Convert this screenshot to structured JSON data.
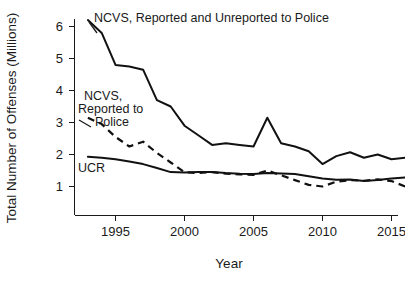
{
  "chart_data": {
    "type": "line",
    "title": "",
    "subtitle": "",
    "xlabel": "Year",
    "ylabel": "Total Number of Offenses (Millions)",
    "xlim": [
      1993,
      2016
    ],
    "ylim": [
      0.45,
      6.45
    ],
    "grid": false,
    "legend_position": "inline-annotations",
    "xticks": [
      1995,
      2000,
      2005,
      2010,
      2015
    ],
    "xtick_labels": [
      "1995",
      "2000",
      "2005",
      "2010",
      "2015"
    ],
    "yticks": [
      1,
      2,
      3,
      4,
      5,
      6
    ],
    "ytick_labels": [
      "1",
      "2",
      "3",
      "4",
      "5",
      "6"
    ],
    "x": [
      1993,
      1994,
      1995,
      1996,
      1997,
      1998,
      1999,
      2000,
      2001,
      2002,
      2003,
      2004,
      2005,
      2006,
      2007,
      2008,
      2009,
      2010,
      2011,
      2012,
      2013,
      2014,
      2015,
      2016
    ],
    "series": [
      {
        "name": "NCVS, Reported and Unreported to Police",
        "style": "solid",
        "values": [
          6.2,
          5.8,
          4.8,
          4.75,
          4.65,
          3.7,
          3.5,
          2.9,
          2.6,
          2.3,
          2.35,
          2.3,
          2.25,
          3.15,
          2.35,
          2.25,
          2.1,
          1.7,
          1.95,
          2.07,
          1.9,
          2.0,
          1.85,
          1.9
        ]
      },
      {
        "name": "NCVS, Reported to Police",
        "style": "dashed",
        "values": [
          3.15,
          2.95,
          2.55,
          2.25,
          2.4,
          2.05,
          1.75,
          1.45,
          1.42,
          1.45,
          1.4,
          1.38,
          1.36,
          1.5,
          1.35,
          1.2,
          1.05,
          1.0,
          1.15,
          1.2,
          1.18,
          1.22,
          1.17,
          1.0
        ]
      },
      {
        "name": "UCR",
        "style": "solid",
        "values": [
          1.93,
          1.9,
          1.85,
          1.78,
          1.7,
          1.58,
          1.45,
          1.44,
          1.45,
          1.45,
          1.42,
          1.4,
          1.39,
          1.42,
          1.41,
          1.39,
          1.32,
          1.25,
          1.21,
          1.22,
          1.17,
          1.2,
          1.25,
          1.28
        ]
      }
    ],
    "annotations": [
      {
        "name": "ncvs-total-label",
        "text": "NCVS, Reported and Unreported to Police"
      },
      {
        "name": "ncvs-reported-label-line1",
        "text": "NCVS,"
      },
      {
        "name": "ncvs-reported-label-line2",
        "text": "Reported to"
      },
      {
        "name": "ncvs-reported-label-line3",
        "text": "Police"
      },
      {
        "name": "ucr-label",
        "text": "UCR"
      }
    ]
  },
  "axes": {
    "y_title": "Total Number of Offenses (Millions)",
    "x_title": "Year",
    "y_labels": [
      "6",
      "5",
      "4",
      "3",
      "2",
      "1"
    ],
    "x_labels": [
      "1995",
      "2000",
      "2005",
      "2010",
      "2015"
    ]
  },
  "annotations": {
    "ncvs_total": "NCVS, Reported and Unreported to Police",
    "ncvs_reported_1": "NCVS,",
    "ncvs_reported_2": "Reported to",
    "ncvs_reported_3": "Police",
    "ucr": "UCR"
  },
  "colors": {
    "ink": "#1a1a1a",
    "line": "#111111",
    "background": "#ffffff"
  }
}
